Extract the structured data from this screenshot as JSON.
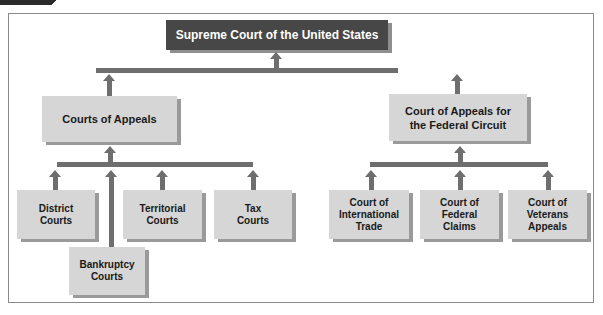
{
  "diagram": {
    "top": {
      "label": "Supreme Court of the United States"
    },
    "level2": [
      {
        "label": "Courts of Appeals"
      },
      {
        "label": "Court of Appeals for the Federal Circuit"
      }
    ],
    "appeals_children": [
      {
        "label": "District Courts"
      },
      {
        "label": "Territorial Courts"
      },
      {
        "label": "Tax Courts"
      },
      {
        "label": "Bankruptcy Courts"
      }
    ],
    "federal_children": [
      {
        "label": "Court of International Trade"
      },
      {
        "label": "Court of Federal Claims"
      },
      {
        "label": "Court of Veterans Appeals"
      }
    ],
    "colors": {
      "top_box": "#474747",
      "box": "#d6d6d6",
      "connector": "#6e6e6e"
    }
  }
}
